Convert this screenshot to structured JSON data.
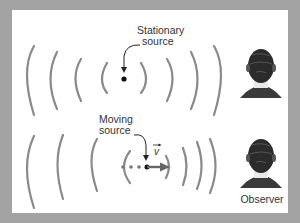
{
  "diagram": {
    "colors": {
      "background": "#a3a3a3",
      "panel": "#ffffff",
      "wavefront": "#8a8a8a",
      "text": "#333333",
      "source_dot": "#111111",
      "trail_dot": "#777777",
      "velocity_arrow": "#666666",
      "head": "#2b2b2b"
    },
    "stationary": {
      "label_line1": "Stationary",
      "label_line2": "source",
      "wavefront_count": 4
    },
    "moving": {
      "label_line1": "Moving",
      "label_line2": "source",
      "velocity_symbol": "v",
      "trail_dot_count": 3,
      "wavefront_count_left": 4,
      "wavefront_count_right": 4
    },
    "observer": {
      "label": "Observer"
    }
  }
}
